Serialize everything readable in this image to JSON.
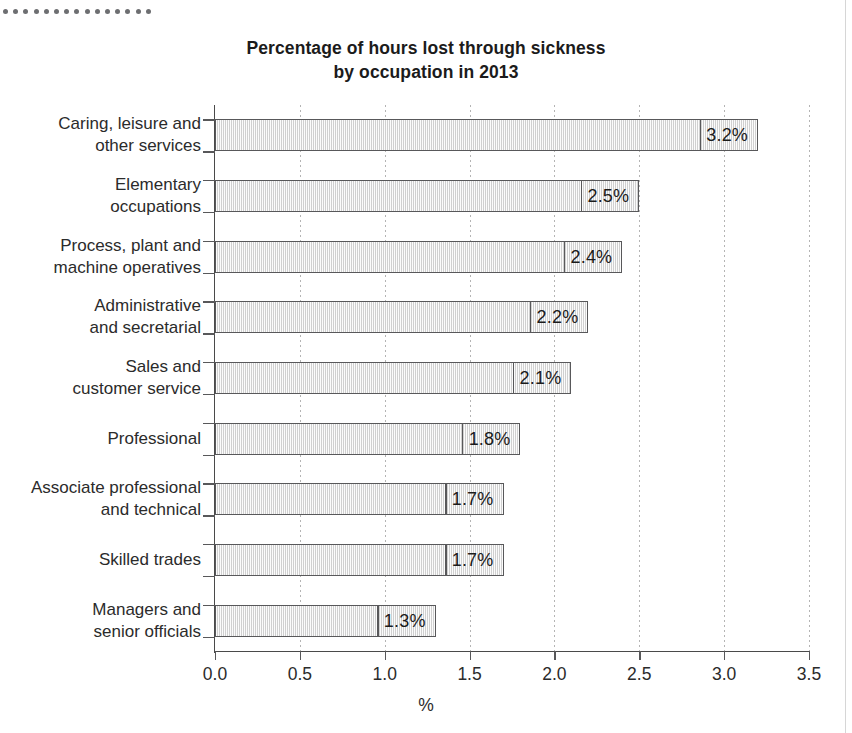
{
  "figure": {
    "title_line1": "Percentage of hours lost through sickness",
    "title_line2": "by occupation in 2013",
    "decoration": {
      "dot_count": 15,
      "dot_color": "#6d6e71"
    },
    "colors": {
      "bar_fill": "#e9e9e9",
      "bar_border": "#58585a",
      "axis": "#4a4a4a",
      "gridline": "#9b9b9b",
      "text": "#2b2b2b"
    }
  },
  "chart_data": {
    "type": "bar",
    "orientation": "horizontal",
    "title": "Percentage of hours lost through sickness by occupation in 2013",
    "xlabel": "%",
    "ylabel": "",
    "xlim": [
      0,
      3.5
    ],
    "xticks": [
      0.0,
      0.5,
      1.0,
      1.5,
      2.0,
      2.5,
      3.0,
      3.5
    ],
    "xtick_labels": [
      "0.0",
      "0.5",
      "1.0",
      "1.5",
      "2.0",
      "2.5",
      "3.0",
      "3.5"
    ],
    "grid": "vertical-dotted",
    "legend": "none",
    "categories": [
      "Caring, leisure and other services",
      "Elementary occupations",
      "Process, plant and machine operatives",
      "Administrative and secretarial",
      "Sales and customer service",
      "Professional",
      "Associate professional and technical",
      "Skilled trades",
      "Managers and senior officials"
    ],
    "category_label_lines": [
      [
        "Caring, leisure and",
        "other services"
      ],
      [
        "Elementary",
        "occupations"
      ],
      [
        "Process, plant and",
        "machine operatives"
      ],
      [
        "Administrative",
        "and secretarial"
      ],
      [
        "Sales and",
        "customer service"
      ],
      [
        "Professional"
      ],
      [
        "Associate professional",
        "and technical"
      ],
      [
        "Skilled trades"
      ],
      [
        "Managers and",
        "senior officials"
      ]
    ],
    "values": [
      3.2,
      2.5,
      2.4,
      2.2,
      2.1,
      1.8,
      1.7,
      1.7,
      1.3
    ],
    "data_labels": [
      "3.2%",
      "2.5%",
      "2.4%",
      "2.2%",
      "2.1%",
      "1.8%",
      "1.7%",
      "1.7%",
      "1.3%"
    ]
  }
}
